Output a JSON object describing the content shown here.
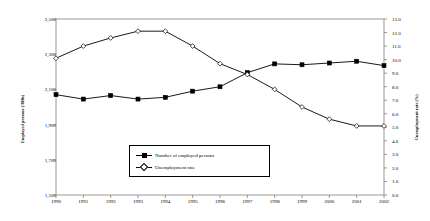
{
  "chart_data": {
    "type": "line",
    "title": "",
    "xlabel": "",
    "categories": [
      "1990",
      "1991",
      "1992",
      "1993",
      "1994",
      "1995",
      "1996",
      "1997",
      "1998",
      "1999",
      "2000",
      "2001",
      "2002"
    ],
    "grid": false,
    "legend_position": "inside-bottom-center",
    "axes": {
      "left": {
        "label": "Employed persons ('000s)",
        "ylim": [
          1500,
          2500
        ],
        "ticks": [
          "1,500",
          "1,700",
          "1,900",
          "2,100",
          "2,300",
          "2,500"
        ],
        "tick_values": [
          1500,
          1700,
          1900,
          2100,
          2300,
          2500
        ]
      },
      "right": {
        "label": "Unemployment rate (%)",
        "ylim": [
          0.0,
          13.0
        ],
        "ticks": [
          "0.0",
          "1.0",
          "2.0",
          "3.0",
          "4.0",
          "5.0",
          "6.0",
          "7.0",
          "8.0",
          "9.0",
          "10.0",
          "11.0",
          "12.0",
          "13.0"
        ],
        "tick_values": [
          0,
          1,
          2,
          3,
          4,
          5,
          6,
          7,
          8,
          9,
          10,
          11,
          12,
          13
        ]
      }
    },
    "series": [
      {
        "name": "Number of employed persons",
        "axis": "left",
        "marker": "filled-square",
        "values": [
          2070,
          2045,
          2065,
          2045,
          2055,
          2090,
          2115,
          2195,
          2245,
          2240,
          2250,
          2260,
          2235
        ]
      },
      {
        "name": "Unemployment rate",
        "axis": "right",
        "marker": "open-diamond",
        "values": [
          10.1,
          11.0,
          11.6,
          12.1,
          12.1,
          11.0,
          9.7,
          8.9,
          7.8,
          6.5,
          5.6,
          5.1,
          5.1
        ]
      }
    ]
  },
  "legend": {
    "items": [
      {
        "label": "Number of employed persons",
        "marker": "filled-square"
      },
      {
        "label": "Unemployment rate",
        "marker": "open-diamond"
      }
    ]
  }
}
